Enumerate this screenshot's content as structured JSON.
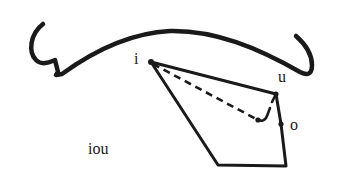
{
  "diagram": {
    "type": "vowel-space",
    "labels": {
      "i": "i",
      "u": "u",
      "o": "o",
      "title": "iou"
    },
    "points": {
      "i": [
        151,
        62
      ],
      "u": [
        276,
        94
      ],
      "o": [
        281,
        124
      ],
      "bottom_right": [
        286,
        166
      ],
      "bottom_left": [
        218,
        165
      ],
      "dash_end": [
        258,
        120
      ]
    },
    "colors": {
      "stroke": "#1a1a1a",
      "background": "#ffffff"
    }
  }
}
